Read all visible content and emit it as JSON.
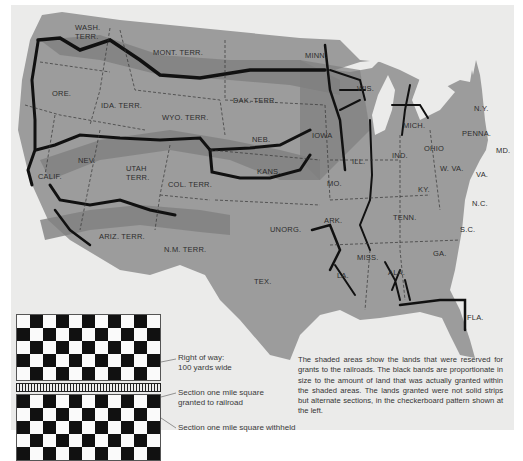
{
  "map": {
    "title": "Railroad land grants in the United States",
    "state_labels": {
      "wash": "WASH.",
      "wash2": "TERR.",
      "mont": "MONT. TERR.",
      "minn": "MINN.",
      "wis": "WIS.",
      "mich": "MICH.",
      "ny": "N.Y.",
      "ore": "ORE.",
      "ida": "IDA. TERR.",
      "wyo": "WYO. TERR.",
      "dak": "DAK. TERR.",
      "iowa": "IOWA",
      "neb": "NEB.",
      "penna": "PENNA.",
      "ohio": "OHIO",
      "ind": "IND.",
      "ill": "ILL.",
      "md": "MD.",
      "nev": "NEV.",
      "utah": "UTAH",
      "utah2": "TERR.",
      "col": "COL. TERR.",
      "kans": "KANS.",
      "mo": "MO.",
      "wva": "W. VA.",
      "va": "VA.",
      "ky": "KY.",
      "calif": "CALIF.",
      "nc": "N.C.",
      "tenn": "TENN.",
      "ark": "ARK.",
      "unorg": "UNORG.",
      "sc": "S.C.",
      "ariz": "ARIZ. TERR.",
      "nm": "N.M. TERR.",
      "ga": "GA.",
      "miss": "MISS.",
      "ala": "ALA.",
      "la": "LA.",
      "tex": "TEX.",
      "fla": "FLA."
    },
    "colors": {
      "land": "#9a9a9a",
      "grant_shade": "#7d7d7d",
      "rail_band": "#111111",
      "background": "#ebebea"
    }
  },
  "legend": {
    "right_of_way_line1": "Right of way:",
    "right_of_way_line2": "100 yards wide",
    "granted_line1": "Section one mile square",
    "granted_line2": "granted to railroad",
    "withheld": "Section one mile square withheld"
  },
  "caption": "The shaded areas show the lands that were reserved for grants to the railroads. The black bands are proportionate in size to the amount of land that was actually granted within the shaded areas. The lands granted were not solid strips but alternate sections, in the checkerboard pattern shown at the left."
}
